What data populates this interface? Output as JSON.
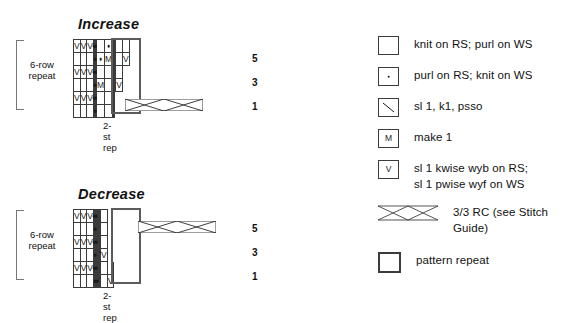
{
  "charts": [
    {
      "id": "increase",
      "title": "Increase",
      "left_label": "6-row\nrepeat",
      "left_label_line1": "6-row",
      "left_label_line2": "repeat",
      "bottom_label": "2-st rep",
      "row_numbers": [
        "5",
        "3",
        "1"
      ],
      "columns": 13,
      "rows": 6,
      "grid": [
        [
          "V",
          "V",
          "V",
          "dot",
          "",
          "dot",
          "",
          "dot",
          "",
          "",
          "",
          "",
          ""
        ],
        [
          "",
          "",
          "",
          "",
          "dot",
          "",
          "dot",
          "M",
          "",
          "",
          "",
          "",
          "V"
        ],
        [
          "V",
          "V",
          "V",
          "dot",
          "",
          "dot",
          "",
          "",
          "",
          "",
          "",
          "",
          null
        ],
        [
          "",
          "",
          "",
          "",
          "dot",
          "",
          "M",
          "",
          "",
          "",
          "",
          "V",
          null
        ],
        [
          "V",
          "V",
          "V",
          "dot",
          "",
          "dot",
          "",
          "",
          "",
          "",
          null,
          null,
          null
        ],
        [
          "",
          "",
          "",
          "",
          "dot",
          "",
          "",
          "",
          "",
          "",
          null,
          null,
          null
        ]
      ],
      "repeat_box": {
        "start_col": 3,
        "span_cols": 2,
        "start_row": 0,
        "span_rows": 6
      },
      "cable": {
        "row": 5,
        "start_col": 4,
        "span_cols": 6
      }
    },
    {
      "id": "decrease",
      "title": "Decrease",
      "left_label_line1": "6-row",
      "left_label_line2": "repeat",
      "bottom_label": "2-st rep",
      "row_numbers": [
        "5",
        "3",
        "1"
      ],
      "columns": 13,
      "rows": 6,
      "grid": [
        [
          "V",
          "V",
          "V",
          "dot",
          "",
          "dot",
          "",
          "",
          "",
          "",
          "",
          null,
          null
        ],
        [
          "",
          "",
          "",
          "",
          "dot",
          "",
          "",
          "",
          "",
          "",
          "",
          null,
          null
        ],
        [
          "V",
          "V",
          "V",
          "dot",
          "",
          "dot",
          "",
          "",
          "",
          "",
          "",
          null,
          null
        ],
        [
          "",
          "",
          "",
          "",
          "dot",
          "",
          "psso",
          "",
          "",
          "",
          "V",
          null,
          null
        ],
        [
          "V",
          "V",
          "V",
          "dot",
          "",
          "dot",
          "",
          "",
          "",
          "",
          "",
          "",
          null
        ],
        [
          "",
          "",
          "",
          "",
          "dot",
          "",
          "dot",
          "psso",
          "",
          "",
          "",
          "V",
          null
        ]
      ],
      "repeat_box": {
        "start_col": 3,
        "span_cols": 2,
        "start_row": 0,
        "span_rows": 6
      },
      "cable": {
        "row": 1,
        "start_col": 5,
        "span_cols": 6
      }
    }
  ],
  "legend": {
    "items": [
      {
        "symbol": "blank-box",
        "text_lines": [
          "knit on RS; purl on WS"
        ]
      },
      {
        "symbol": "dot-box",
        "text_lines": [
          "purl on RS; knit on WS"
        ]
      },
      {
        "symbol": "psso-box",
        "text_lines": [
          "sl 1, k1, psso"
        ]
      },
      {
        "symbol": "make-one-box",
        "glyph": "M",
        "text_lines": [
          "make 1"
        ]
      },
      {
        "symbol": "slip-box",
        "glyph": "V",
        "text_lines": [
          "sl 1 kwise wyb on RS;",
          "sl 1 pwise wyf on WS"
        ]
      },
      {
        "symbol": "cable-glyph",
        "text_lines": [
          "3/3 RC (see Stitch Guide)"
        ]
      },
      {
        "symbol": "pattern-repeat-box",
        "text_lines": [
          "pattern repeat"
        ]
      }
    ]
  },
  "colors": {
    "grid_line": "#3b3b3b",
    "repeat_box": "#5b5b5b",
    "text": "#111111",
    "bracket": "#777777"
  }
}
